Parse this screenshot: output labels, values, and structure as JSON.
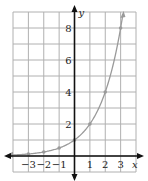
{
  "chart_data": {
    "type": "line",
    "title": "",
    "xlabel": "x",
    "ylabel": "y",
    "function": "y = 2^x",
    "x": [
      -3,
      -2,
      -1,
      0,
      1,
      2,
      3
    ],
    "series": [
      {
        "name": "y = 2^x",
        "values": [
          0.125,
          0.25,
          0.5,
          1,
          2,
          4,
          8
        ],
        "color": "#9a9a9a"
      }
    ],
    "x_ticks": [
      -3,
      -2,
      -1,
      1,
      2,
      3
    ],
    "x_tick_labels": [
      "−3",
      "−2",
      "−1",
      "1",
      "2",
      "3"
    ],
    "y_ticks": [
      2,
      4,
      6,
      8
    ],
    "y_tick_labels": [
      "2",
      "4",
      "6",
      "8"
    ],
    "xlim": [
      -4,
      4
    ],
    "ylim": [
      -1,
      9
    ],
    "grid": true,
    "legend": "none"
  },
  "colors": {
    "grid": "#b0b0b0",
    "axis": "#111111",
    "curve": "#9a9a9a",
    "points": "#9a9a9a"
  }
}
